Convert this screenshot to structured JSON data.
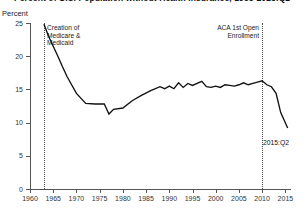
{
  "chart_data": {
    "type": "line",
    "title": "Percent of U.S. Population without Health Insurance, 1963-2015:Q2",
    "ylabel": "Percent",
    "xlabel": "",
    "ylim": [
      0,
      25
    ],
    "yticks": [
      0,
      5,
      10,
      15,
      20,
      25
    ],
    "ytick_labels": [
      "0",
      "5",
      "10",
      "15",
      "20",
      "25"
    ],
    "xlim": [
      1960,
      2016
    ],
    "xticks": [
      1960,
      1965,
      1970,
      1975,
      1980,
      1985,
      1990,
      1995,
      2000,
      2005,
      2010,
      2015
    ],
    "xtick_labels": [
      "1960",
      "1965",
      "1970",
      "1975",
      "1980",
      "1985",
      "1990",
      "1995",
      "2000",
      "2005",
      "2010",
      "2015"
    ],
    "grid": false,
    "legend": false,
    "line_color": "#111111",
    "series": [
      {
        "name": "Uninsured share of U.S. population",
        "x": [
          1963,
          1964,
          1965,
          1966,
          1967,
          1968,
          1970,
          1972,
          1974,
          1976,
          1977,
          1978,
          1980,
          1982,
          1984,
          1986,
          1988,
          1989,
          1990,
          1991,
          1992,
          1993,
          1994,
          1995,
          1996,
          1997,
          1998,
          1999,
          2000,
          2001,
          2002,
          2003,
          2004,
          2005,
          2006,
          2007,
          2008,
          2009,
          2010,
          2011,
          2012,
          2013,
          2014,
          2015.5
        ],
        "values": [
          24.8,
          23.0,
          21.5,
          20.0,
          18.4,
          16.9,
          14.4,
          12.9,
          12.8,
          12.8,
          11.3,
          12.0,
          12.2,
          13.3,
          14.1,
          14.8,
          15.4,
          15.1,
          15.5,
          15.1,
          16.0,
          15.3,
          15.9,
          15.6,
          15.9,
          16.2,
          15.4,
          15.3,
          15.5,
          15.3,
          15.7,
          15.6,
          15.5,
          15.7,
          16.0,
          15.7,
          15.9,
          16.1,
          16.3,
          15.7,
          15.4,
          14.4,
          11.5,
          9.2
        ],
        "color": "#111111"
      }
    ],
    "annotations": [
      {
        "id": "medicare-medicaid",
        "label": "Creation of\nMedicare &\nMedicaid",
        "x": 1965,
        "line_style": "dotted"
      },
      {
        "id": "aca-first-open-enrollment",
        "label": "ACA 1st Open\nEnrollment",
        "x": 2013.8,
        "line_style": "dotted"
      },
      {
        "id": "final-point",
        "label": "2015:Q2",
        "x": 2015.5,
        "y": 9.2
      }
    ]
  }
}
